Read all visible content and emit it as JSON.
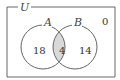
{
  "diagram": {
    "type": "venn",
    "universe_label": "U",
    "sets": [
      {
        "name": "A",
        "label": "A"
      },
      {
        "name": "B",
        "label": "B"
      }
    ],
    "regions": {
      "a_only": "18",
      "a_and_b": "4",
      "b_only": "14",
      "outside": "0"
    },
    "shaded_region": "A∩B",
    "colors": {
      "stroke": "#666666",
      "shade": "#d9d9d9",
      "background": "#ffffff"
    }
  }
}
